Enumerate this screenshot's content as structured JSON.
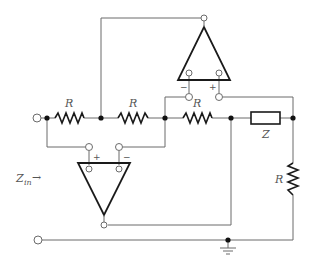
{
  "diagram": {
    "type": "circuit-schematic",
    "labels": {
      "r1": "R",
      "r2": "R",
      "r3": "R",
      "r4": "R",
      "z": "Z",
      "zin_main": "Z",
      "zin_sub": "in",
      "zin_arrow": "→",
      "top_opamp_minus": "−",
      "top_opamp_plus": "+",
      "bottom_opamp_plus": "+",
      "bottom_opamp_minus": "−"
    },
    "components": [
      {
        "id": "R1",
        "kind": "resistor",
        "label": "R",
        "orientation": "horizontal"
      },
      {
        "id": "R2",
        "kind": "resistor",
        "label": "R",
        "orientation": "horizontal"
      },
      {
        "id": "R3",
        "kind": "resistor",
        "label": "R",
        "orientation": "horizontal"
      },
      {
        "id": "Z",
        "kind": "impedance",
        "label": "Z",
        "orientation": "horizontal"
      },
      {
        "id": "R4",
        "kind": "resistor",
        "label": "R",
        "orientation": "vertical"
      },
      {
        "id": "OA1",
        "kind": "op-amp",
        "position": "top",
        "inputs": [
          "−",
          "+"
        ]
      },
      {
        "id": "OA2",
        "kind": "op-amp",
        "position": "bottom",
        "inputs": [
          "+",
          "−"
        ]
      },
      {
        "id": "GND",
        "kind": "ground"
      }
    ],
    "colors": {
      "wire": "#6b6b6b",
      "component": "#1a1a1a",
      "label": "#555555"
    }
  }
}
